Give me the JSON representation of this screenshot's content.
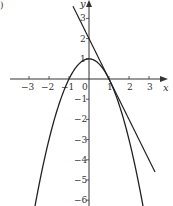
{
  "chart_data": {
    "type": "line",
    "title": "",
    "xlabel": "x",
    "ylabel": "y",
    "xlim": [
      -3.6,
      3.6
    ],
    "ylim": [
      -6.3,
      3.9
    ],
    "grid": false,
    "x_ticks": [
      -3,
      -2,
      -1,
      0,
      1,
      2,
      3
    ],
    "x_tick_labels": [
      "−3",
      "−2",
      "−1",
      "0",
      "1",
      "2",
      "3"
    ],
    "y_ticks": [
      3,
      2,
      1,
      -1,
      -2,
      -3,
      -4,
      -5,
      -6
    ],
    "y_tick_labels": [
      "3",
      "2",
      "1",
      "−1",
      "−2",
      "−3",
      "−4",
      "−5",
      "−6"
    ],
    "series": [
      {
        "name": "parabola",
        "equation": "y = 1 - x^2",
        "x": [
          -2.7,
          -2,
          -1.5,
          -1,
          -0.5,
          0,
          0.5,
          1,
          1.5,
          2,
          2.7
        ],
        "y": [
          -6.29,
          -3,
          -1.25,
          0,
          0.75,
          1,
          0.75,
          0,
          -1.25,
          -3,
          -6.29
        ],
        "color": "#222222"
      },
      {
        "name": "tangent line at x=1",
        "equation": "y = 2 - 2x",
        "x": [
          -0.8,
          3.3
        ],
        "y": [
          3.6,
          -4.6
        ],
        "color": "#222222"
      }
    ],
    "legend": null
  },
  "labels": {
    "corner_mark": ")",
    "x_axis": "x",
    "y_axis": "y",
    "origin": "0"
  }
}
